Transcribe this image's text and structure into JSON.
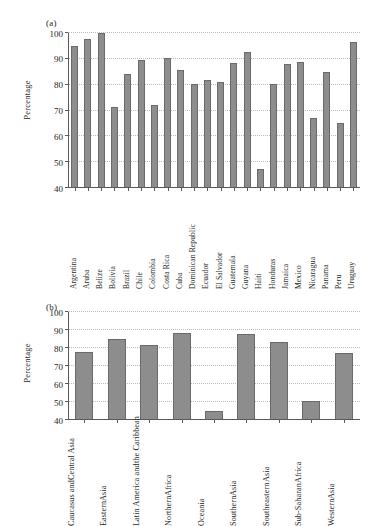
{
  "figure": {
    "panels": [
      {
        "tag": "(a)",
        "ylabel": "Percentage"
      },
      {
        "tag": "(b)",
        "ylabel": "Percentage"
      }
    ],
    "bar_color": "#8d8d8d",
    "bar_edge_color": "#6a6a6a",
    "grid_color": "#b9bbbd",
    "axis_color": "#58595b"
  },
  "chart_data": [
    {
      "type": "bar",
      "title": "(a)",
      "xlabel": "",
      "ylabel": "Percentage",
      "ylim": [
        40,
        100
      ],
      "yticks": [
        40,
        50,
        60,
        70,
        80,
        90,
        100
      ],
      "grid": true,
      "legend": "none",
      "categories": [
        "Argentina",
        "Aruba",
        "Belize",
        "Bolivia",
        "Brazil",
        "Chile",
        "Colombia",
        "Costa Rica",
        "Cuba",
        "Dominican Republic",
        "Ecuador",
        "El Salvador",
        "Guatemala",
        "Guyana",
        "Haiti",
        "Honduras",
        "Jamaica",
        "Mexico",
        "Nicaragua",
        "Panama",
        "Peru",
        "Uruguay"
      ],
      "values": [
        95.0,
        97.5,
        100.0,
        71.3,
        84.0,
        89.6,
        72.1,
        90.4,
        85.8,
        80.2,
        81.7,
        80.9,
        88.2,
        92.6,
        47.5,
        80.1,
        87.9,
        88.8,
        67.0,
        85.1,
        65.0,
        96.7
      ]
    },
    {
      "type": "bar",
      "title": "(b)",
      "xlabel": "",
      "ylabel": "Percentage",
      "ylim": [
        40,
        100
      ],
      "yticks": [
        40,
        50,
        60,
        70,
        80,
        90,
        100
      ],
      "grid": true,
      "legend": "none",
      "categories": [
        "Caucasus and Central Asia",
        "Eastern Asia",
        "Latin America and the Caribbean",
        "Northern Africa",
        "Oceania",
        "Southern Asia",
        "Southeastern Asia",
        "Sub-Saharan Africa",
        "Western Asia"
      ],
      "category_lines": [
        [
          "Caucasus and",
          "Central Asia"
        ],
        [
          "Eastern",
          "Asia"
        ],
        [
          "Latin America and",
          "the Caribbean"
        ],
        [
          "Northern",
          "Africa"
        ],
        [
          "Oceania",
          ""
        ],
        [
          "Southern",
          "Asia"
        ],
        [
          "Southeastern",
          "Asia"
        ],
        [
          "Sub-Saharan",
          "Africa"
        ],
        [
          "Western",
          "Asia"
        ]
      ],
      "values": [
        77.8,
        84.9,
        81.8,
        88.6,
        45.0,
        87.8,
        83.6,
        50.7,
        77.2
      ]
    }
  ]
}
